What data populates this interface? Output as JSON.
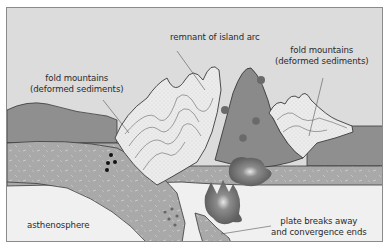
{
  "diagram": {
    "labels": {
      "remnant_arc": {
        "line1": "remnant of island arc"
      },
      "fold_left": {
        "line1": "fold mountains",
        "line2": "(deformed sediments)"
      },
      "fold_right": {
        "line1": "fold mountains",
        "line2": "(deformed sediments)"
      },
      "asthenosphere": {
        "line1": "asthenosphere"
      },
      "plate_break": {
        "line1": "plate breaks away",
        "line2": "and convergence ends"
      }
    },
    "colors": {
      "sky": "#dcdcdc",
      "continental_crust": "#8f8f8f",
      "lithosphere": "#a9a9a9",
      "sediments": "#ececec",
      "island_arc": "#8a8a8a",
      "asthenosphere": "#f0f0f0",
      "magma": "#6e6e6e",
      "outline": "#3a3a3a"
    }
  }
}
